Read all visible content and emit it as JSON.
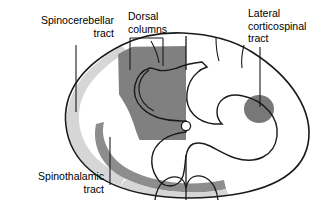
{
  "figure": {
    "type": "anatomical-diagram",
    "background_color": "#ffffff",
    "outline_color": "#1a1a1a"
  },
  "labels": {
    "spinocerebellar": "Spinocerebellar\ntract",
    "dorsal_columns": "Dorsal\ncolumns",
    "lateral_corticospinal": "Lateral\ncorticospinal\ntract",
    "spinothalamic": "Spinothalamic\ntract"
  },
  "regions": [
    {
      "name": "dorsal-columns",
      "label_key": "dorsal_columns",
      "fill": "#808080",
      "description": "large dark gray wedge filling the left posterior funiculus up to the midline"
    },
    {
      "name": "spinocerebellar-tract",
      "label_key": "spinocerebellar",
      "fill": "#d5d5d5",
      "description": "light gray crescent along the lateral left margin of the cord"
    },
    {
      "name": "lateral-corticospinal-tract",
      "label_key": "lateral_corticospinal",
      "fill": "#787878",
      "description": "dark gray oval in the right lateral funiculus"
    },
    {
      "name": "spinothalamic-tract",
      "label_key": "spinothalamic",
      "fill": "#8c8c8c",
      "description": "dark gray band sweeping along the anterolateral left quadrant"
    },
    {
      "name": "central-canal",
      "fill": "#ffffff",
      "description": "small circle at the center of the cord"
    }
  ],
  "leaders": {
    "spinocerebellar": "vertical line from label down to the light gray crescent",
    "dorsal_columns": "bracket with two downward ticks spanning the dark wedge",
    "lateral_corticospinal": "vertical line from label down to the dark oval",
    "spinothalamic": "vertical line from the dark anterolateral band up-right to the label"
  }
}
